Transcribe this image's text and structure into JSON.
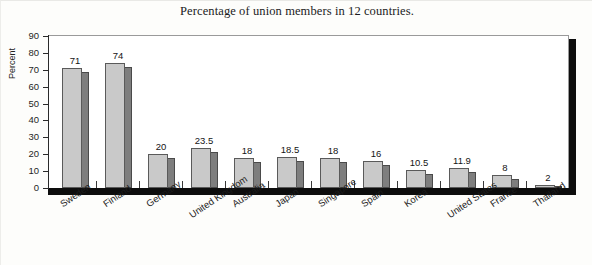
{
  "chart_data": {
    "type": "bar",
    "title": "Percentage of union members in 12 countries.",
    "xlabel": "",
    "ylabel": "Percent",
    "ylim": [
      0,
      90
    ],
    "ytick_step": 10,
    "yticks": [
      90,
      80,
      70,
      60,
      50,
      40,
      30,
      20,
      10,
      0
    ],
    "grid": false,
    "legend": "none",
    "style": "3d-bar",
    "categories": [
      "Sweden",
      "Finland",
      "Germany",
      "United Kingdom",
      "Australia",
      "Japan",
      "Singapore",
      "Spain",
      "Korea",
      "United States",
      "France",
      "Thailand"
    ],
    "values": [
      71,
      74,
      20,
      23.5,
      18,
      18.5,
      18,
      16,
      10.5,
      11.9,
      8,
      2
    ],
    "value_labels": [
      "71",
      "74",
      "20",
      "23.5",
      "18",
      "18.5",
      "18",
      "16",
      "10.5",
      "11.9",
      "8",
      "2"
    ],
    "colors": {
      "bar_front": "#c9c9c9",
      "bar_side": "#7e7e7e",
      "bar_edge": "#5a5a5a",
      "axis": "#2a2a2a",
      "wall": "#0d0d0d",
      "background": "#fdfdfb",
      "plot_background": "#ffffff",
      "text": "#1b1b1b"
    }
  }
}
